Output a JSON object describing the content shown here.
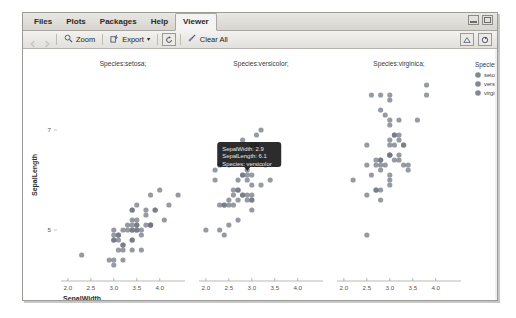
{
  "window": {
    "tabs": [
      {
        "label": "Files",
        "active": false
      },
      {
        "label": "Plots",
        "active": false
      },
      {
        "label": "Packages",
        "active": false
      },
      {
        "label": "Help",
        "active": false
      },
      {
        "label": "Viewer",
        "active": true
      }
    ],
    "controls": {
      "minimize": "minimize-window",
      "maximize": "maximize-window"
    }
  },
  "toolbar": {
    "back": "back-arrow-icon",
    "forward": "forward-arrow-icon",
    "zoom_label": "Zoom",
    "export_label": "Export",
    "export_caret": "▾",
    "refresh_icon": "refresh-icon",
    "clear_label": "Clear All",
    "right_icons": [
      "publish-icon",
      "refresh-icon"
    ]
  },
  "chart_data": {
    "type": "scatter",
    "title": "",
    "xlabel": "SepalWidth",
    "ylabel": "SepalLength",
    "xlim": [
      1.85,
      4.55
    ],
    "ylim": [
      4.1,
      8.1
    ],
    "xticks": [
      2.0,
      2.5,
      3.0,
      3.5,
      4.0
    ],
    "yticks": [
      5,
      7
    ],
    "grid": false,
    "facet_by": "Species",
    "panels": [
      {
        "strip": "Species:setosa;",
        "name": "setosa",
        "points": [
          [
            3.5,
            5.1
          ],
          [
            3.0,
            4.9
          ],
          [
            3.2,
            4.7
          ],
          [
            3.1,
            4.6
          ],
          [
            3.6,
            5.0
          ],
          [
            3.9,
            5.4
          ],
          [
            3.4,
            4.6
          ],
          [
            3.4,
            5.0
          ],
          [
            2.9,
            4.4
          ],
          [
            3.1,
            4.9
          ],
          [
            3.7,
            5.4
          ],
          [
            3.4,
            4.8
          ],
          [
            3.0,
            4.8
          ],
          [
            3.0,
            4.3
          ],
          [
            4.0,
            5.8
          ],
          [
            4.4,
            5.7
          ],
          [
            3.9,
            5.4
          ],
          [
            3.5,
            5.1
          ],
          [
            3.8,
            5.7
          ],
          [
            3.8,
            5.1
          ],
          [
            3.4,
            5.4
          ],
          [
            3.7,
            5.1
          ],
          [
            3.6,
            4.6
          ],
          [
            3.3,
            5.1
          ],
          [
            3.4,
            4.8
          ],
          [
            3.0,
            5.0
          ],
          [
            3.4,
            5.0
          ],
          [
            3.5,
            5.2
          ],
          [
            3.4,
            5.2
          ],
          [
            3.2,
            4.7
          ],
          [
            3.1,
            4.8
          ],
          [
            3.4,
            5.4
          ],
          [
            4.1,
            5.2
          ],
          [
            4.2,
            5.5
          ],
          [
            3.1,
            4.9
          ],
          [
            3.2,
            5.0
          ],
          [
            3.5,
            5.5
          ],
          [
            3.6,
            4.9
          ],
          [
            3.0,
            4.4
          ],
          [
            3.4,
            5.1
          ],
          [
            3.5,
            5.0
          ],
          [
            2.3,
            4.5
          ],
          [
            3.2,
            4.4
          ],
          [
            3.5,
            5.0
          ],
          [
            3.8,
            5.1
          ],
          [
            3.0,
            4.8
          ],
          [
            3.8,
            5.1
          ],
          [
            3.2,
            4.6
          ],
          [
            3.7,
            5.3
          ],
          [
            3.3,
            5.0
          ]
        ]
      },
      {
        "strip": "Species:versicolor;",
        "name": "versicolor",
        "points": [
          [
            3.2,
            7.0
          ],
          [
            3.2,
            6.4
          ],
          [
            3.1,
            6.9
          ],
          [
            2.3,
            5.5
          ],
          [
            2.8,
            6.5
          ],
          [
            2.8,
            5.7
          ],
          [
            3.3,
            6.3
          ],
          [
            2.4,
            4.9
          ],
          [
            2.9,
            6.6
          ],
          [
            2.7,
            5.2
          ],
          [
            2.0,
            5.0
          ],
          [
            3.0,
            5.9
          ],
          [
            2.2,
            6.0
          ],
          [
            2.9,
            6.1
          ],
          [
            2.9,
            5.6
          ],
          [
            3.1,
            6.7
          ],
          [
            3.0,
            5.6
          ],
          [
            2.7,
            5.8
          ],
          [
            2.2,
            6.2
          ],
          [
            2.5,
            5.6
          ],
          [
            3.2,
            5.9
          ],
          [
            2.8,
            6.1
          ],
          [
            2.5,
            6.3
          ],
          [
            2.8,
            6.1
          ],
          [
            2.9,
            6.4
          ],
          [
            3.0,
            6.6
          ],
          [
            2.8,
            6.8
          ],
          [
            3.0,
            6.7
          ],
          [
            2.9,
            6.0
          ],
          [
            2.6,
            5.7
          ],
          [
            2.4,
            5.5
          ],
          [
            2.4,
            5.5
          ],
          [
            2.7,
            5.8
          ],
          [
            2.7,
            6.0
          ],
          [
            3.0,
            5.4
          ],
          [
            3.4,
            6.0
          ],
          [
            3.1,
            6.7
          ],
          [
            2.3,
            6.3
          ],
          [
            3.0,
            5.6
          ],
          [
            2.5,
            5.5
          ],
          [
            2.6,
            5.5
          ],
          [
            3.0,
            6.1
          ],
          [
            2.6,
            5.8
          ],
          [
            2.3,
            5.0
          ],
          [
            2.7,
            5.6
          ],
          [
            3.0,
            5.7
          ],
          [
            2.9,
            5.7
          ],
          [
            2.9,
            6.2
          ],
          [
            2.5,
            5.1
          ],
          [
            2.8,
            5.7
          ]
        ]
      },
      {
        "strip": "Species:virginica;",
        "name": "virginica",
        "points": [
          [
            3.3,
            6.3
          ],
          [
            2.7,
            5.8
          ],
          [
            3.0,
            7.1
          ],
          [
            2.9,
            6.3
          ],
          [
            3.0,
            6.5
          ],
          [
            3.0,
            7.6
          ],
          [
            2.5,
            4.9
          ],
          [
            2.9,
            7.3
          ],
          [
            2.5,
            6.7
          ],
          [
            3.6,
            7.2
          ],
          [
            3.2,
            6.5
          ],
          [
            2.7,
            6.4
          ],
          [
            3.0,
            6.8
          ],
          [
            2.5,
            5.7
          ],
          [
            2.8,
            5.8
          ],
          [
            3.2,
            6.4
          ],
          [
            3.0,
            6.5
          ],
          [
            3.8,
            7.7
          ],
          [
            2.6,
            7.7
          ],
          [
            2.2,
            6.0
          ],
          [
            3.2,
            6.9
          ],
          [
            2.8,
            5.6
          ],
          [
            2.8,
            7.7
          ],
          [
            2.7,
            6.3
          ],
          [
            3.3,
            6.7
          ],
          [
            3.2,
            7.2
          ],
          [
            2.8,
            6.2
          ],
          [
            3.0,
            6.1
          ],
          [
            2.8,
            6.4
          ],
          [
            3.0,
            7.2
          ],
          [
            2.8,
            7.4
          ],
          [
            3.8,
            7.9
          ],
          [
            2.8,
            6.4
          ],
          [
            2.8,
            6.3
          ],
          [
            2.6,
            6.1
          ],
          [
            3.0,
            7.7
          ],
          [
            3.4,
            6.3
          ],
          [
            3.1,
            6.4
          ],
          [
            3.0,
            6.0
          ],
          [
            3.1,
            6.9
          ],
          [
            3.1,
            6.7
          ],
          [
            3.1,
            6.9
          ],
          [
            2.7,
            5.8
          ],
          [
            3.2,
            6.8
          ],
          [
            3.3,
            6.7
          ],
          [
            3.0,
            6.7
          ],
          [
            2.5,
            6.3
          ],
          [
            3.0,
            6.5
          ],
          [
            3.4,
            6.2
          ],
          [
            3.0,
            5.9
          ]
        ]
      }
    ],
    "legend": {
      "position": "right",
      "title": "Species",
      "entries": [
        "setosa",
        "versicolor",
        "virginica"
      ]
    },
    "point_color": "#6e7380",
    "tooltip": {
      "lines": [
        "SepalWidth: 2.9",
        "SepalLength: 6.1",
        "Species: versicolor"
      ],
      "anchor_x": 2.9,
      "anchor_y": 6.1,
      "panel": 1
    }
  }
}
